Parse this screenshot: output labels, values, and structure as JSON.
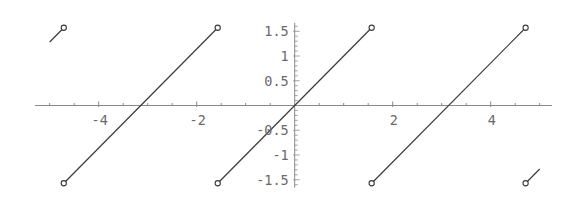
{
  "chart_data": {
    "type": "line",
    "title": "",
    "xlabel": "",
    "ylabel": "",
    "function": "x - Pi*Round(x/Pi)",
    "xlim": [
      -5.3,
      5.25
    ],
    "ylim": [
      -1.66,
      1.67
    ],
    "grid": false,
    "legend": null,
    "x_ticks": [
      -4,
      -2,
      2,
      4
    ],
    "x_tick_labels": [
      "-4",
      "-2",
      "2",
      "4"
    ],
    "y_ticks": [
      1.5,
      1,
      0.5,
      -0.5,
      -1,
      -1.5
    ],
    "y_tick_labels": [
      "1.5",
      "1",
      "0.5",
      "-0.5",
      "-1",
      "-1.5"
    ],
    "series": [
      {
        "name": "sawtooth",
        "segments": [
          {
            "x": [
              -5.0,
              -4.7124
            ],
            "y": [
              1.2832,
              1.5708
            ],
            "open_end": true
          },
          {
            "x": [
              -4.7124,
              -1.5708
            ],
            "y": [
              -1.5708,
              1.5708
            ],
            "open_start": true,
            "open_end": true
          },
          {
            "x": [
              -1.5708,
              1.5708
            ],
            "y": [
              -1.5708,
              1.5708
            ],
            "open_start": true,
            "open_end": true
          },
          {
            "x": [
              1.5708,
              4.7124
            ],
            "y": [
              -1.5708,
              1.5708
            ],
            "open_start": true,
            "open_end": true
          },
          {
            "x": [
              4.7124,
              5.0
            ],
            "y": [
              -1.5708,
              -1.2832
            ],
            "open_start": true
          }
        ],
        "open_points": [
          [
            -4.7124,
            1.5708
          ],
          [
            -4.7124,
            -1.5708
          ],
          [
            -1.5708,
            1.5708
          ],
          [
            -1.5708,
            -1.5708
          ],
          [
            1.5708,
            1.5708
          ],
          [
            1.5708,
            -1.5708
          ],
          [
            4.7124,
            1.5708
          ],
          [
            4.7124,
            -1.5708
          ]
        ]
      }
    ],
    "colors": {
      "curve": "#3a3a3a",
      "axis": "#8a8a8a",
      "labels": "#6a6a6a"
    }
  }
}
